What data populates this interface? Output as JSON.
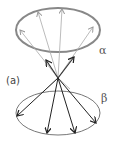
{
  "diagram": {
    "panel_label": "(a)",
    "upper_cone_label": "α",
    "lower_cone_label": "β",
    "colors": {
      "upper_ellipse": "#888888",
      "upper_arrows": "#999999",
      "lower_ellipse": "#777777",
      "lower_arrows": "#222222"
    }
  }
}
